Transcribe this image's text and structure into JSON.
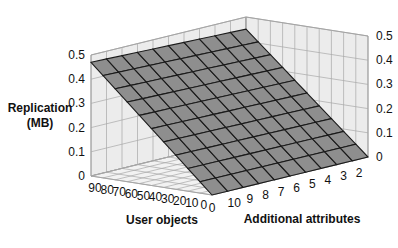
{
  "chart_data": {
    "type": "surface3d",
    "title": "",
    "zlabel": "Replication (MB)",
    "zlabel_lines": [
      "Replication",
      "(MB)"
    ],
    "xlabel": "User objects",
    "ylabel": "Additional attributes",
    "x_ticks": [
      "90",
      "80",
      "70",
      "60",
      "50",
      "40",
      "30",
      "20",
      "10",
      "0"
    ],
    "y_ticks": [
      "0",
      "10",
      "9",
      "8",
      "7",
      "6",
      "5",
      "4",
      "3",
      "2"
    ],
    "z_ticks": [
      "0",
      "0.1",
      "0.2",
      "0.3",
      "0.4",
      "0.5"
    ],
    "zlim": [
      0,
      0.5
    ],
    "grid": true,
    "surface_description": "Planar surface rising linearly with user objects; nearly flat across additional attributes",
    "corner_values": {
      "user_objects_90_attr_0": 0.47,
      "user_objects_90_attr_2": 0.45,
      "user_objects_0_attr_0": 0.0,
      "user_objects_0_attr_2": 0.0
    }
  },
  "labels": {
    "z_left_top": "Replication",
    "z_left_bottom": "(MB)",
    "x_axis": "User objects",
    "y_axis": "Additional attributes"
  }
}
